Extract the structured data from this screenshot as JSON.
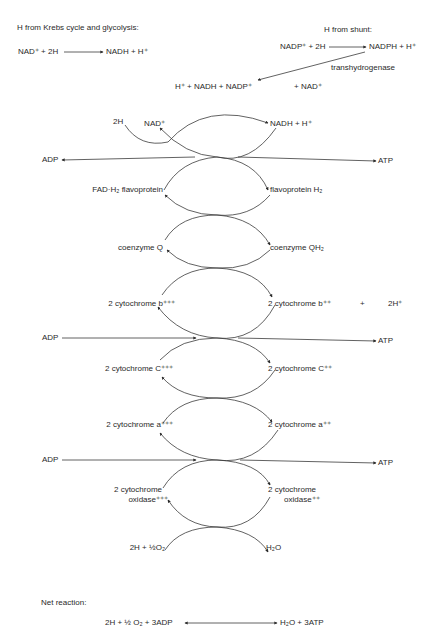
{
  "header": {
    "left_title": "H from Krebs cycle and glycolysis:",
    "right_title": "H from shunt:"
  },
  "top_reactions": {
    "krebs": {
      "reactants": "NAD⁺ + 2H",
      "products": "NADH + H⁺"
    },
    "shunt": {
      "reactants": "NADP⁺ + 2H",
      "products": "NADPH + H⁺"
    },
    "transhydrogenase_label": "transhydrogenase",
    "transhydrogenase_reactants": "H⁺ + NADH + NADP⁺",
    "transhydrogenase_products": "+ NAD⁺",
    "input_2h": "2H"
  },
  "chain": [
    {
      "left": "NAD⁺",
      "right": "NADH + H⁺"
    },
    {
      "left": "FAD·H₂ flavoprotein",
      "right": "flavoprotein H₂"
    },
    {
      "left": "coenzyme Q",
      "right": "coenzyme QH₂"
    },
    {
      "left": "2 cytochrome b⁺⁺⁺",
      "right": "2 cytochrome b⁺⁺",
      "extra_plus": "+",
      "extra": "2H⁺"
    },
    {
      "left": "2 cytochrome C⁺⁺⁺",
      "right": "2 cytochrome C⁺⁺"
    },
    {
      "left": "2 cytochrome a⁺⁺⁺",
      "right": "2 cytochrome a⁺⁺"
    },
    {
      "left_line1": "2 cytochrome",
      "left_line2": "oxidase⁺⁺⁺",
      "right_line1": "2 cytochrome",
      "right_line2": "oxidase⁺⁺"
    },
    {
      "left": "2H + ½O₂",
      "right": "H₂O"
    }
  ],
  "phosphorylation": [
    {
      "input": "ADP",
      "output": "ATP"
    },
    {
      "input": "ADP",
      "output": "ATP"
    },
    {
      "input": "ADP",
      "output": "ATP"
    }
  ],
  "net": {
    "label": "Net reaction:",
    "reactants": "2H + ½ O₂ + 3ADP",
    "products": "H₂O + 3ATP"
  },
  "colors": {
    "ink": "#2a2a2a",
    "background": "#ffffff"
  }
}
